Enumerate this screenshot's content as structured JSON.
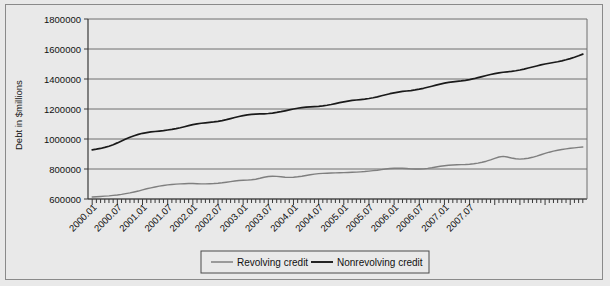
{
  "chart_data": {
    "type": "line",
    "title": "",
    "xlabel": "",
    "ylabel": "Debt in $millions",
    "ylim": [
      600000,
      1800000
    ],
    "ytick_step": 200000,
    "yticks": [
      "600000",
      "800000",
      "1000000",
      "1200000",
      "1400000",
      "1600000",
      "1800000"
    ],
    "grid": true,
    "legend_position": "bottom",
    "x_tick_labels": [
      "2000.01",
      "2000.07",
      "2001.01",
      "2001.07",
      "2002.01",
      "2002.07",
      "2003.01",
      "2003.07",
      "2004.01",
      "2004.07",
      "2005.01",
      "2005.07",
      "2006.01",
      "2006.07",
      "2007.01",
      "2007.07"
    ],
    "x_start": "2000.01",
    "x_end": "2007.10",
    "x_interval_months": 1,
    "series": [
      {
        "name": "Revolving credit",
        "color": "#7f7f7f",
        "values": [
          613000,
          615000,
          617000,
          619000,
          621000,
          624000,
          627000,
          631000,
          636000,
          641000,
          647000,
          653000,
          661000,
          668000,
          674000,
          680000,
          686000,
          690000,
          694000,
          697000,
          699000,
          701000,
          702000,
          703000,
          703000,
          702000,
          701000,
          701000,
          702000,
          703000,
          705000,
          708000,
          712000,
          716000,
          720000,
          723000,
          725000,
          726000,
          728000,
          732000,
          738000,
          745000,
          750000,
          752000,
          751000,
          748000,
          745000,
          744000,
          745000,
          748000,
          752000,
          757000,
          762000,
          766000,
          769000,
          771000,
          772000,
          773000,
          774000,
          775000,
          776000,
          777000,
          778000,
          779000,
          781000,
          783000,
          786000,
          789000,
          792000,
          796000,
          800000,
          803000,
          805000,
          806000,
          805000,
          803000,
          801000,
          800000,
          800000,
          801000,
          804000,
          808000,
          813000,
          818000,
          822000,
          825000,
          827000,
          828000,
          829000,
          830000,
          832000,
          835000,
          839000,
          845000,
          852000,
          861000,
          871000,
          880000,
          884000,
          880000,
          873000,
          868000,
          866000,
          868000,
          872000,
          878000,
          886000,
          895000,
          904000,
          912000,
          919000,
          925000,
          930000,
          934000,
          938000,
          941000,
          944000,
          947000
        ]
      },
      {
        "name": "Nonrevolving credit",
        "color": "#1a1a1a",
        "values": [
          928000,
          932000,
          937000,
          944000,
          952000,
          962000,
          974000,
          987000,
          1000000,
          1012000,
          1022000,
          1031000,
          1038000,
          1043000,
          1047000,
          1050000,
          1053000,
          1056000,
          1060000,
          1064000,
          1069000,
          1075000,
          1082000,
          1089000,
          1096000,
          1101000,
          1105000,
          1108000,
          1111000,
          1114000,
          1118000,
          1123000,
          1129000,
          1136000,
          1143000,
          1150000,
          1156000,
          1161000,
          1164000,
          1166000,
          1167000,
          1168000,
          1170000,
          1173000,
          1177000,
          1182000,
          1188000,
          1194000,
          1200000,
          1205000,
          1209000,
          1212000,
          1214000,
          1216000,
          1218000,
          1221000,
          1225000,
          1230000,
          1236000,
          1242000,
          1248000,
          1253000,
          1257000,
          1260000,
          1263000,
          1266000,
          1270000,
          1275000,
          1281000,
          1288000,
          1295000,
          1302000,
          1308000,
          1313000,
          1317000,
          1320000,
          1323000,
          1327000,
          1332000,
          1338000,
          1345000,
          1352000,
          1359000,
          1366000,
          1372000,
          1377000,
          1381000,
          1384000,
          1387000,
          1391000,
          1396000,
          1402000,
          1409000,
          1416000,
          1423000,
          1430000,
          1436000,
          1441000,
          1445000,
          1448000,
          1451000,
          1455000,
          1460000,
          1466000,
          1473000,
          1480000,
          1487000,
          1494000,
          1500000,
          1505000,
          1510000,
          1515000,
          1521000,
          1528000,
          1536000,
          1545000,
          1555000,
          1566000
        ]
      }
    ]
  },
  "legend": {
    "items": [
      {
        "label": "Revolving credit"
      },
      {
        "label": "Nonrevolving credit"
      }
    ]
  },
  "axes": {
    "y_axis_title": "Debt in $millions"
  }
}
